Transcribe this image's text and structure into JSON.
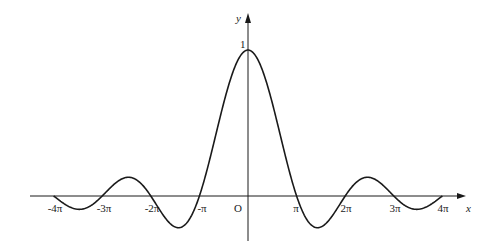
{
  "chart_data": {
    "type": "line",
    "title": "",
    "function": "y = sin(x)/x",
    "xlabel": "x",
    "ylabel": "y",
    "origin_label": "O",
    "x_ticks": [
      {
        "value": -12.566,
        "label": "-4π"
      },
      {
        "value": -9.425,
        "label": "-3π"
      },
      {
        "value": -6.283,
        "label": "-2π"
      },
      {
        "value": -3.1416,
        "label": "-π"
      },
      {
        "value": 3.1416,
        "label": "π"
      },
      {
        "value": 6.283,
        "label": "2π"
      },
      {
        "value": 9.425,
        "label": "3π"
      },
      {
        "value": 12.566,
        "label": "4π"
      }
    ],
    "y_ticks": [
      {
        "value": 1,
        "label": "1"
      }
    ],
    "xlim": [
      -12.566,
      12.566
    ],
    "ylim": [
      -0.22,
      1
    ],
    "grid": false,
    "legend": null,
    "series": [
      {
        "name": "sin(x)/x",
        "x": [
          -12.566,
          -10.904,
          -9.425,
          -7.725,
          -6.283,
          -4.493,
          -3.1416,
          -1.5708,
          0,
          1.5708,
          3.1416,
          4.493,
          6.283,
          7.725,
          9.425,
          10.904,
          12.566
        ],
        "values": [
          0,
          -0.091,
          0,
          0.128,
          0,
          -0.217,
          0,
          0.637,
          1,
          0.637,
          0,
          -0.217,
          0,
          0.128,
          0,
          -0.091,
          0
        ]
      }
    ],
    "colors": {
      "curve": "#1a1a1a",
      "axes": "#1a1a1a"
    }
  }
}
